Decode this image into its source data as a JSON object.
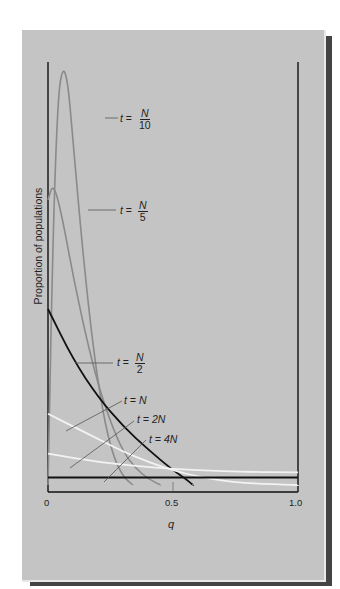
{
  "caption": "Hartl & Clark, 2007",
  "chart_data": {
    "type": "line",
    "title": "",
    "xlabel": "q",
    "ylabel": "Proportion of populations",
    "xlim": [
      0,
      1.0
    ],
    "x_ticks": [
      "0",
      "0.5",
      "1.0"
    ],
    "y_ticks": [],
    "grid": false,
    "legend_position": "inline-annotations",
    "series": [
      {
        "name": "t = N/10",
        "color": "#8a8a8a",
        "points": [
          [
            0,
            0.0
          ],
          [
            0.02,
            0.6
          ],
          [
            0.04,
            0.93
          ],
          [
            0.06,
            1.0
          ],
          [
            0.08,
            0.96
          ],
          [
            0.1,
            0.82
          ],
          [
            0.14,
            0.55
          ],
          [
            0.18,
            0.33
          ],
          [
            0.22,
            0.17
          ],
          [
            0.26,
            0.07
          ],
          [
            0.3,
            0.02
          ],
          [
            0.34,
            0.0
          ]
        ]
      },
      {
        "name": "t = N/5",
        "color": "#8a8a8a",
        "points": [
          [
            0,
            0.68
          ],
          [
            0.02,
            0.72
          ],
          [
            0.05,
            0.66
          ],
          [
            0.1,
            0.5
          ],
          [
            0.15,
            0.36
          ],
          [
            0.2,
            0.24
          ],
          [
            0.25,
            0.15
          ],
          [
            0.3,
            0.08
          ],
          [
            0.35,
            0.04
          ],
          [
            0.4,
            0.015
          ],
          [
            0.45,
            0.0
          ]
        ]
      },
      {
        "name": "t = N/2",
        "color": "#111111",
        "points": [
          [
            0,
            0.42
          ],
          [
            0.1,
            0.3
          ],
          [
            0.2,
            0.21
          ],
          [
            0.3,
            0.14
          ],
          [
            0.4,
            0.085
          ],
          [
            0.5,
            0.035
          ],
          [
            0.55,
            0.015
          ],
          [
            0.58,
            0.0
          ]
        ]
      },
      {
        "name": "t = N",
        "color": "#f2f2f2",
        "points": [
          [
            0,
            0.17
          ],
          [
            0.1,
            0.14
          ],
          [
            0.2,
            0.11
          ],
          [
            0.3,
            0.08
          ],
          [
            0.4,
            0.055
          ],
          [
            0.5,
            0.035
          ],
          [
            0.6,
            0.02
          ],
          [
            0.7,
            0.01
          ],
          [
            0.8,
            0.004
          ],
          [
            1.0,
            0.0
          ]
        ]
      },
      {
        "name": "t = 2N",
        "color": "#f2f2f2",
        "points": [
          [
            0,
            0.075
          ],
          [
            0.2,
            0.055
          ],
          [
            0.4,
            0.042
          ],
          [
            0.6,
            0.035
          ],
          [
            0.8,
            0.031
          ],
          [
            1.0,
            0.03
          ]
        ]
      },
      {
        "name": "t = 4N",
        "color": "#111111",
        "points": [
          [
            0,
            0.018
          ],
          [
            0.5,
            0.018
          ],
          [
            1.0,
            0.018
          ]
        ]
      }
    ],
    "annotations": [
      {
        "text": "t = N/10",
        "target_series": "t = N/10"
      },
      {
        "text": "t = N/5",
        "target_series": "t = N/5"
      },
      {
        "text": "t = N/2",
        "target_series": "t = N/2"
      },
      {
        "text": "t = N",
        "target_series": "t = N"
      },
      {
        "text": "t = 2N",
        "target_series": "t = 2N"
      },
      {
        "text": "t = 4N",
        "target_series": "t = 4N"
      }
    ]
  },
  "labels": {
    "n10": {
      "t": "t",
      "eq": "=",
      "num": "N",
      "den": "10"
    },
    "n5": {
      "t": "t",
      "eq": "=",
      "num": "N",
      "den": "5"
    },
    "n2": {
      "t": "t",
      "eq": "=",
      "num": "N",
      "den": "2"
    },
    "n1": {
      "text": "t = N"
    },
    "n2x": {
      "text": "t = 2N"
    },
    "n4x": {
      "text": "t = 4N"
    }
  },
  "axes": {
    "ylabel": "Proportion of populations",
    "xlabel": "q",
    "x0": "0",
    "x05": "0.5",
    "x1": "1.0"
  }
}
